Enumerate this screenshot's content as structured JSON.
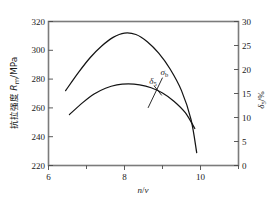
{
  "chart_data": {
    "type": "line",
    "title": "",
    "xlabel": "n/v",
    "xlabel_parts": {
      "n": "n",
      "slash": "/",
      "v": "v"
    },
    "ylabel_left": "抗拉强度 Rm/MPa",
    "ylabel_left_parts": {
      "cn": "抗拉强度 ",
      "sym": "R",
      "sub": "m",
      "unit": "/MPa"
    },
    "ylabel_right": "δ5/%",
    "ylabel_right_parts": {
      "sym": "δ",
      "sub": "5",
      "unit": "/%"
    },
    "xlim": [
      6,
      11
    ],
    "xticks": [
      6,
      8,
      10
    ],
    "xticks_minor": [
      7,
      9,
      11
    ],
    "ylim_left": [
      220,
      320
    ],
    "yticks_left": [
      220,
      240,
      260,
      280,
      300,
      320
    ],
    "ylim_right": [
      0,
      30
    ],
    "yticks_right": [
      0,
      5,
      10,
      15,
      20,
      25,
      30
    ],
    "grid": false,
    "legend": "inline annotations",
    "series": [
      {
        "name": "σb",
        "name_parts": {
          "sym": "σ",
          "sub": "b"
        },
        "axis": "left",
        "unit": "MPa",
        "label_position": {
          "x": 9.05,
          "y": 283
        },
        "x": [
          6.45,
          6.8,
          7.1,
          7.4,
          7.7,
          8.0,
          8.3,
          8.6,
          8.9,
          9.2,
          9.5,
          9.75,
          9.9
        ],
        "y": [
          272,
          285,
          295,
          303,
          309,
          312,
          311,
          306,
          298,
          287,
          272,
          252,
          229
        ]
      },
      {
        "name": "δ5",
        "name_parts": {
          "sym": "δ",
          "sub": "5"
        },
        "axis": "right",
        "unit": "%",
        "label_position": {
          "x": 8.75,
          "y": 16.9
        },
        "x": [
          6.55,
          6.9,
          7.2,
          7.5,
          7.8,
          8.1,
          8.4,
          8.7,
          9.0,
          9.3,
          9.6,
          9.85
        ],
        "y": [
          10.6,
          13.1,
          14.9,
          16.1,
          16.8,
          17.0,
          16.8,
          16.2,
          15.1,
          13.4,
          11.0,
          7.7
        ]
      }
    ],
    "annotations": [
      {
        "name": "sigma-b-leader",
        "from": [
          9.0,
          281
        ],
        "to": [
          8.62,
          260
        ]
      },
      {
        "name": "delta-5-leader",
        "from": [
          8.78,
          16.6
        ],
        "to": [
          8.98,
          14.6
        ]
      }
    ]
  }
}
